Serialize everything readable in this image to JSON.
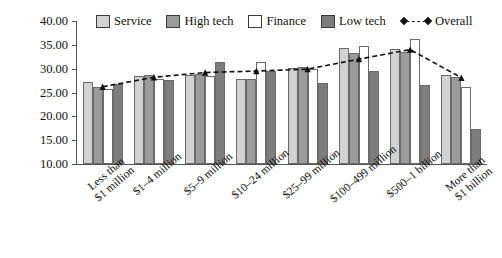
{
  "chart_data": {
    "type": "bar",
    "title": "",
    "xlabel": "",
    "ylabel": "",
    "ylim": [
      10.0,
      40.0
    ],
    "ytick_step": 5.0,
    "ytick_labels": [
      "40.00",
      "35.00",
      "30.00",
      "25.00",
      "20.00",
      "15.00",
      "10.00"
    ],
    "grid": false,
    "legend_position": "top",
    "categories": [
      "Less than $1 million",
      "$1–4 million",
      "$5–9 million",
      "$10–24 million",
      "$25–99 million",
      "$100–499 million",
      "$500–1 billion",
      "More than $1 billion"
    ],
    "category_lines": [
      [
        "Less than",
        "$1 million"
      ],
      [
        "$1–4 million"
      ],
      [
        "$5–9 million"
      ],
      [
        "$10–24 million"
      ],
      [
        "$25–99 million"
      ],
      [
        "$100–499 million"
      ],
      [
        "$500–1 billion"
      ],
      [
        "More than",
        "$1 billion"
      ]
    ],
    "series": [
      {
        "name": "Service",
        "type": "bar",
        "color": "#d2d2d2",
        "values": [
          27.2,
          28.4,
          28.6,
          27.8,
          30.2,
          34.3,
          34.2,
          28.6
        ]
      },
      {
        "name": "High tech",
        "type": "bar",
        "color": "#9b9b9b",
        "values": [
          26.2,
          28.6,
          28.8,
          27.9,
          30.3,
          33.2,
          33.4,
          28.2
        ]
      },
      {
        "name": "Finance",
        "type": "bar",
        "color": "#ffffff",
        "values": [
          25.7,
          27.9,
          28.4,
          31.4,
          29.9,
          34.7,
          36.3,
          26.2
        ]
      },
      {
        "name": "Low tech",
        "type": "bar",
        "color": "#7d7d7d",
        "values": [
          26.8,
          27.7,
          31.4,
          29.5,
          27.1,
          29.6,
          26.5,
          17.3
        ]
      },
      {
        "name": "Overall",
        "type": "line",
        "color": "#111111",
        "style": "dashed",
        "marker": "triangle",
        "values": [
          26.2,
          28.2,
          29.2,
          29.5,
          29.9,
          32.0,
          34.0,
          28.1
        ]
      }
    ]
  },
  "legend": {
    "items": [
      {
        "label": "Service",
        "swatch": "legend-swatch-service"
      },
      {
        "label": "High tech",
        "swatch": "legend-swatch-high-tech"
      },
      {
        "label": "Finance",
        "swatch": "legend-swatch-finance"
      },
      {
        "label": "Low tech",
        "swatch": "legend-swatch-low-tech"
      },
      {
        "label": "Overall",
        "swatch": "legend-line-overall"
      }
    ]
  }
}
